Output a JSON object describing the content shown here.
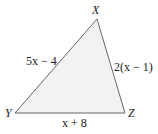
{
  "diagram": {
    "type": "triangle",
    "fill": "#f2f2f2",
    "stroke": "#666666",
    "vertices": [
      {
        "name": "X",
        "x": 97,
        "y": 19
      },
      {
        "name": "Y",
        "x": 15,
        "y": 113
      },
      {
        "name": "Z",
        "x": 125,
        "y": 113
      }
    ],
    "labels": {
      "vertex_x": "X",
      "vertex_y": "Y",
      "vertex_z": "Z",
      "side_xy": "5x − 4",
      "side_xz": "2(x − 1)",
      "side_yz": "x + 8"
    }
  }
}
